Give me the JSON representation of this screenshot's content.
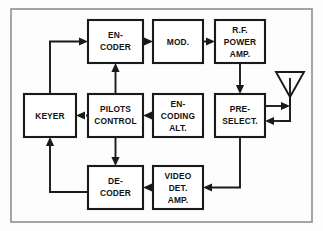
{
  "diagram": {
    "frame": {
      "label": "diagram-frame",
      "stroke_color": "#8f8f93"
    },
    "style": {
      "box_stroke": "#1a1a1a",
      "line_stroke": "#1a1a1a",
      "background": "#fdfdfd"
    },
    "blocks": [
      {
        "id": "encoder",
        "name": "encoder-block",
        "lines": [
          "EN-",
          "CODER"
        ],
        "x": 88,
        "y": 20,
        "w": 55,
        "h": 43
      },
      {
        "id": "modulator",
        "name": "modulator-block",
        "lines": [
          "MOD."
        ],
        "x": 153,
        "y": 20,
        "w": 50,
        "h": 43
      },
      {
        "id": "rf_power_amp",
        "name": "rf-power-amp-block",
        "lines": [
          "R.F.",
          "POWER",
          "AMP."
        ],
        "x": 215,
        "y": 20,
        "w": 50,
        "h": 43
      },
      {
        "id": "keyer",
        "name": "keyer-block",
        "lines": [
          "KEYER"
        ],
        "x": 24,
        "y": 94,
        "w": 52,
        "h": 43
      },
      {
        "id": "pilots_control",
        "name": "pilots-control-block",
        "lines": [
          "PILOTS",
          "CONTROL"
        ],
        "x": 88,
        "y": 94,
        "w": 55,
        "h": 43
      },
      {
        "id": "encoding_alt",
        "name": "encoding-alt-block",
        "lines": [
          "EN-",
          "CODING",
          "ALT."
        ],
        "x": 153,
        "y": 94,
        "w": 50,
        "h": 43
      },
      {
        "id": "preselect",
        "name": "preselector-block",
        "lines": [
          "PRE-",
          "SELECT."
        ],
        "x": 215,
        "y": 94,
        "w": 50,
        "h": 43
      },
      {
        "id": "decoder",
        "name": "decoder-block",
        "lines": [
          "DE-",
          "CODER"
        ],
        "x": 88,
        "y": 166,
        "w": 55,
        "h": 43
      },
      {
        "id": "video_det_amp",
        "name": "video-det-amp-block",
        "lines": [
          "VIDEO",
          "DET.",
          "AMP."
        ],
        "x": 153,
        "y": 166,
        "w": 50,
        "h": 43
      }
    ],
    "antenna": {
      "name": "antenna-symbol",
      "type": "triangle-dipole"
    },
    "connections": [
      {
        "name": "connection-keyer-to-encoder",
        "from": "keyer",
        "to": "encoder",
        "arrow": "right"
      },
      {
        "name": "connection-encoder-to-modulator",
        "from": "encoder",
        "to": "modulator",
        "arrow": "right"
      },
      {
        "name": "connection-modulator-to-rf-power-amp",
        "from": "modulator",
        "to": "rf_power_amp",
        "arrow": "right"
      },
      {
        "name": "connection-rf-power-amp-to-preselect",
        "from": "rf_power_amp",
        "to": "preselect",
        "arrow": "down"
      },
      {
        "name": "connection-preselect-to-antenna",
        "from": "preselect",
        "to": "antenna",
        "arrow": "right"
      },
      {
        "name": "connection-antenna-to-preselect",
        "from": "antenna",
        "to": "preselect",
        "arrow": "left"
      },
      {
        "name": "connection-preselect-to-video-det",
        "from": "preselect",
        "to": "video_det_amp",
        "arrow": "left"
      },
      {
        "name": "connection-video-det-to-decoder",
        "from": "video_det_amp",
        "to": "decoder",
        "arrow": "left"
      },
      {
        "name": "connection-decoder-to-keyer",
        "from": "decoder",
        "to": "keyer",
        "arrow": "up"
      },
      {
        "name": "connection-pilots-to-encoder",
        "from": "pilots_control",
        "to": "encoder",
        "arrow": "up"
      },
      {
        "name": "connection-pilots-to-decoder",
        "from": "pilots_control",
        "to": "decoder",
        "arrow": "down"
      },
      {
        "name": "connection-pilots-to-keyer",
        "from": "pilots_control",
        "to": "keyer",
        "arrow": "left"
      },
      {
        "name": "connection-encoding-alt-to-pilots",
        "from": "encoding_alt",
        "to": "pilots_control",
        "arrow": "left"
      }
    ]
  }
}
